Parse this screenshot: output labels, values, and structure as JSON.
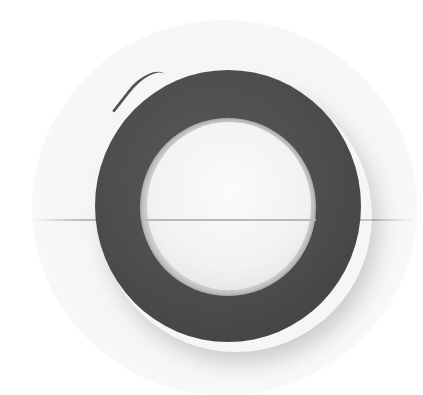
{
  "image": {
    "subject": "roll of dark gray tape on white background",
    "colors": {
      "background": "#ffffff",
      "backdrop": "#f4f4f4",
      "tape": "#4c4c4c",
      "core": "#f2f2f2",
      "line": "#b5b5b5"
    }
  }
}
